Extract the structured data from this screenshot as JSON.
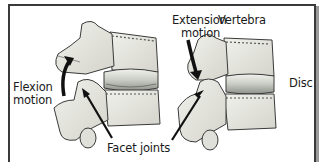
{
  "diagram": {
    "type": "anatomical-illustration",
    "labels": {
      "flexion": [
        "Flexion",
        "motion"
      ],
      "extension": [
        "Extension",
        "motion"
      ],
      "vertebra": "Vertebra",
      "disc": "Disc",
      "facet_joints": "Facet joints"
    },
    "panels": [
      {
        "name": "flexion-segment",
        "motion_label": "Flexion motion",
        "arrow_direction": "upward-curved"
      },
      {
        "name": "extension-segment",
        "motion_label": "Extension motion",
        "arrow_direction": "downward-curved"
      }
    ],
    "colors": {
      "bone": "#e6e6e0",
      "bone_shade": "#b8b8b0",
      "outline": "#3a3a3a",
      "disc": "#cfd3cc",
      "arrow": "#111111",
      "frame": "#3a3a3a"
    }
  }
}
